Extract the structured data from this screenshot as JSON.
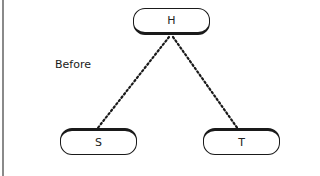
{
  "diagram": {
    "label": "Before",
    "nodes": [
      {
        "id": "H",
        "text": "H"
      },
      {
        "id": "S",
        "text": "S"
      },
      {
        "id": "T",
        "text": "T"
      }
    ],
    "edges": [
      {
        "from": "H",
        "to": "S",
        "style": "dotted"
      },
      {
        "from": "H",
        "to": "T",
        "style": "dotted"
      }
    ],
    "colors": {
      "line": "#1a1a1a",
      "frame": "#8a8a8a",
      "background": "#ffffff"
    }
  }
}
